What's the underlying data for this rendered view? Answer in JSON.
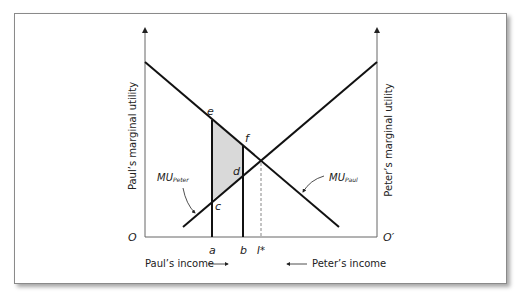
{
  "diagram": {
    "y_axis_left_label": "Paul’s marginal utility",
    "y_axis_right_label": "Peter’s marginal utility",
    "origin_left": "O",
    "origin_right": "O′",
    "x_axis_left_label": "Paul’s income",
    "x_axis_right_label": "Peter’s income",
    "tick_labels": {
      "a": "a",
      "b": "b",
      "istar": "I*"
    },
    "points": {
      "c": "c",
      "d": "d",
      "e": "e",
      "f": "f"
    },
    "curves": {
      "mu_paul": {
        "base": "MU",
        "sub": "Paul"
      },
      "mu_peter": {
        "base": "MU",
        "sub": "Peter"
      }
    },
    "colors": {
      "line": "#111111",
      "shade": "#d9d9d9",
      "dashed": "#888888",
      "frame": "#8a8a8a"
    }
  }
}
